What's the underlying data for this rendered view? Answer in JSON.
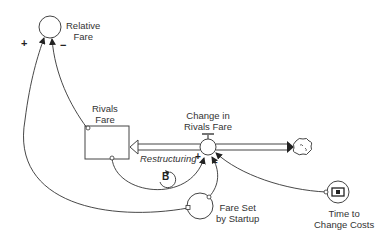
{
  "diagram": {
    "type": "stock-and-flow",
    "nodes": {
      "relative_fare": {
        "label_line1": "Relative",
        "label_line2": "Fare",
        "kind": "auxiliary"
      },
      "rivals_fare": {
        "label_line1": "Rivals",
        "label_line2": "Fare",
        "kind": "stock"
      },
      "change_in_rivals_fare": {
        "label_line1": "Change in",
        "label_line2": "Rivals Fare",
        "kind": "flow-valve"
      },
      "fare_set_by_startup": {
        "label_line1": "Fare Set",
        "label_line2": "by Startup",
        "kind": "auxiliary"
      },
      "time_to_change_costs": {
        "label_line1": "Time to",
        "label_line2": "Change Costs",
        "kind": "constant"
      },
      "cloud": {
        "kind": "source-sink",
        "icon": "cloud-icon"
      }
    },
    "loop": {
      "name": "Restructuring",
      "polarity": "B"
    },
    "links": [
      {
        "from": "fare_set_by_startup",
        "to": "relative_fare",
        "polarity": "+"
      },
      {
        "from": "rivals_fare",
        "to": "relative_fare",
        "polarity": "−"
      },
      {
        "from": "rivals_fare",
        "to": "change_in_rivals_fare",
        "polarity": "+"
      },
      {
        "from": "fare_set_by_startup",
        "to": "change_in_rivals_fare",
        "polarity": "−"
      },
      {
        "from": "time_to_change_costs",
        "to": "change_in_rivals_fare",
        "polarity": ""
      }
    ],
    "signs": {
      "plus_relative": "+",
      "minus_relative": "−",
      "plus_flow": "+",
      "minus_flow": "−"
    }
  }
}
